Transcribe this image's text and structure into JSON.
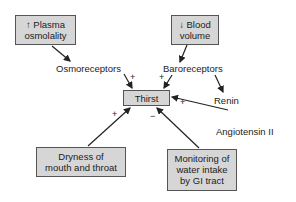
{
  "diagram": {
    "title": "",
    "nodes": {
      "plasma": {
        "arrow": "↑",
        "line1": "Plasma",
        "line2": "osmolality"
      },
      "blood": {
        "arrow": "↓",
        "line1": "Blood",
        "line2": "volume"
      },
      "osmoreceptors": "Osmoreceptors",
      "baroreceptors": "Baroreceptors",
      "thirst": "Thirst",
      "renin": "Renin",
      "angiotensin": "Angiotensin II",
      "dryness": {
        "line1": "Dryness of",
        "line2": "mouth and throat"
      },
      "monitoring": {
        "line1": "Monitoring of",
        "line2": "water intake",
        "line3": "by GI tract"
      }
    },
    "signs": {
      "osmo_to_thirst": "+",
      "baro_to_thirst": "+",
      "angio_to_thirst": "+",
      "dryness_to_thirst": "+",
      "monitoring_to_thirst": "−"
    },
    "colors": {
      "box_fill": "#d6d6d6",
      "box_border": "#555555",
      "arrow": "#222222"
    }
  }
}
